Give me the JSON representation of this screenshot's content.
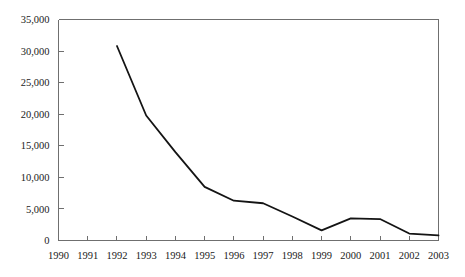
{
  "chart_data": {
    "type": "line",
    "title": "",
    "subtitle": "",
    "xlabel": "",
    "ylabel": "",
    "categories": [
      "1990",
      "1991",
      "1992",
      "1993",
      "1994",
      "1995",
      "1996",
      "1997",
      "1998",
      "1999",
      "2000",
      "2001",
      "2002",
      "2003"
    ],
    "x": [
      1990,
      1991,
      1992,
      1993,
      1994,
      1995,
      1996,
      1997,
      1998,
      1999,
      2000,
      2001,
      2002,
      2003
    ],
    "values": [
      null,
      null,
      30800,
      19800,
      14000,
      8500,
      6300,
      5900,
      3800,
      1600,
      3500,
      3400,
      1100,
      800
    ],
    "series": [
      {
        "name": "",
        "x": [
          1992,
          1993,
          1994,
          1995,
          1996,
          1997,
          1998,
          1999,
          2000,
          2001,
          2002,
          2003
        ],
        "values": [
          30800,
          19800,
          14000,
          8500,
          6300,
          5900,
          3800,
          1600,
          3500,
          3400,
          1100,
          800
        ]
      }
    ],
    "xlim": [
      1990,
      2003
    ],
    "ylim": [
      0,
      35000
    ],
    "y_ticks": [
      0,
      5000,
      10000,
      15000,
      20000,
      25000,
      30000,
      35000
    ],
    "y_tick_labels": [
      "0",
      "5,000",
      "10,000",
      "15,000",
      "20,000",
      "25,000",
      "30,000",
      "35,000"
    ],
    "x_ticks": [
      1990,
      1991,
      1992,
      1993,
      1994,
      1995,
      1996,
      1997,
      1998,
      1999,
      2000,
      2001,
      2002,
      2003
    ],
    "x_tick_labels": [
      "1990",
      "1991",
      "1992",
      "1993",
      "1994",
      "1995",
      "1996",
      "1997",
      "1998",
      "1999",
      "2000",
      "2001",
      "2002",
      "2003"
    ],
    "grid": false,
    "legend": null,
    "legend_position": "none",
    "annotations": [],
    "colors": {
      "line": "#141414",
      "axis": "#6f6f6f",
      "text": "#1a1a1a",
      "background": "#ffffff"
    }
  },
  "figure": {
    "width": 465,
    "height": 277
  }
}
